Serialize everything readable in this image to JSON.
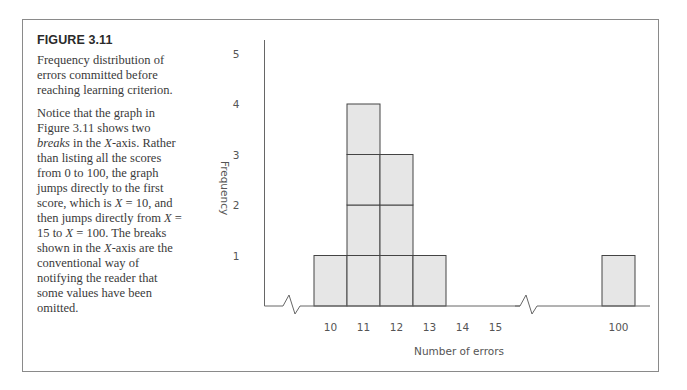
{
  "figure": {
    "title": "FIGURE 3.11",
    "description": "Frequency distribution of errors committed before reaching learning criterion.",
    "note_parts": [
      "Notice that the graph in Figure 3.11 shows two ",
      "breaks",
      " in the ",
      "X",
      "-axis. Rather than listing all the scores from 0 to 100, the graph jumps directly to the first score, which is ",
      "X",
      " = 10, and then jumps directly from ",
      "X",
      " = 15 to ",
      "X",
      " = 100. The breaks shown in the ",
      "X",
      "-axis are the conventional way of notifying the reader that some values have been omitted."
    ]
  },
  "chart_data": {
    "type": "bar",
    "title": "",
    "xlabel": "Number of errors",
    "ylabel": "Frequency",
    "categories": [
      "10",
      "11",
      "12",
      "13",
      "14",
      "15",
      "100"
    ],
    "values": [
      1,
      4,
      3,
      1,
      0,
      0,
      1
    ],
    "ylim": [
      0,
      5
    ],
    "yticks": [
      "1",
      "2",
      "3",
      "4",
      "5"
    ],
    "axis_breaks": [
      "between 0 and 10",
      "between 15 and 100"
    ],
    "grid": false,
    "bar_style": "stacked unit blocks",
    "bar_color": "#e6e6e6",
    "edge_color": "#444444"
  }
}
